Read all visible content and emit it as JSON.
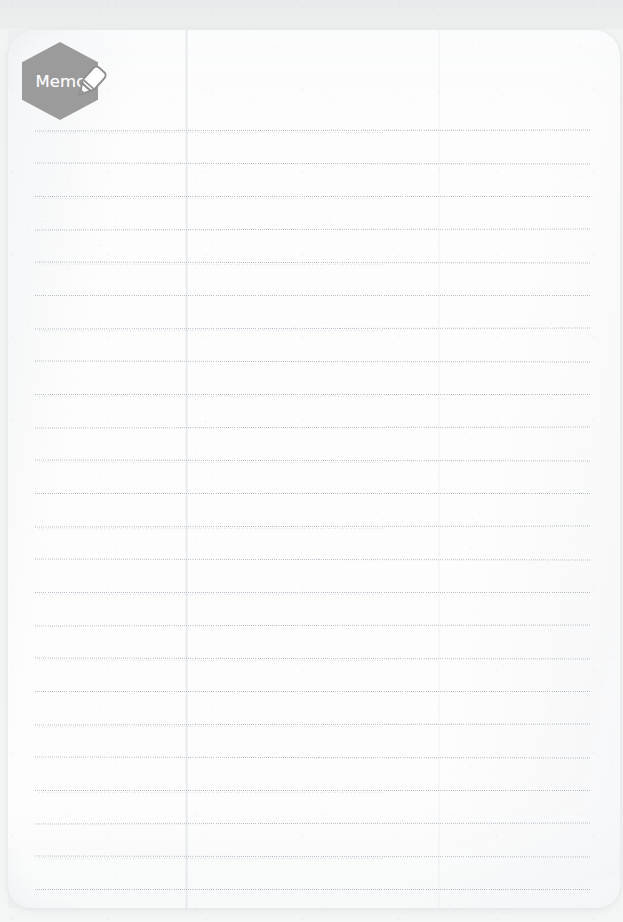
{
  "page": {
    "kind": "memo-notepad-page",
    "badge": {
      "label": "Memo",
      "shape": "hexagon",
      "fill_color": "#9b9b9b",
      "text_color": "#ffffff",
      "icon": "marker-pen-icon",
      "icon_body_color": "#ffffff",
      "icon_outline_color": "#8e8e8e"
    },
    "paper": {
      "background_color": "#fdfdfd",
      "surround_color": "#eceded",
      "corner_radius_px": 26
    },
    "ruled_lines": {
      "style": "dotted",
      "color": "#a0aaba",
      "count": 24,
      "spacing_px": 33,
      "first_line_y_px": 130,
      "left_x_px": 35,
      "right_x_px": 590,
      "content": [
        "",
        "",
        "",
        "",
        "",
        "",
        "",
        "",
        "",
        "",
        "",
        "",
        "",
        "",
        "",
        "",
        "",
        "",
        "",
        "",
        "",
        "",
        "",
        ""
      ]
    },
    "notes_text": ""
  }
}
